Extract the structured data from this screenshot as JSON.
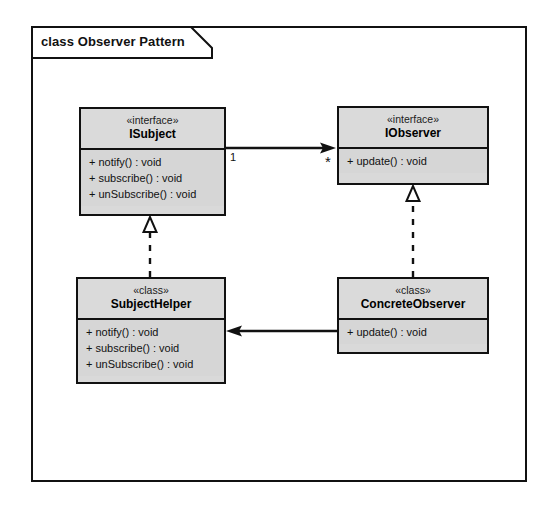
{
  "diagram": {
    "frame_label": "class Observer Pattern",
    "type": "uml-class-diagram"
  },
  "classes": [
    {
      "id": "isubject",
      "stereotype": "«interface»",
      "name": "ISubject",
      "members": [
        "+ notify()  :  void",
        "+ subscribe()  :  void",
        "+ unSubscribe()  :  void"
      ]
    },
    {
      "id": "iobserver",
      "stereotype": "«interface»",
      "name": "IObserver",
      "members": [
        "+ update()  :  void"
      ]
    },
    {
      "id": "subjecthelper",
      "stereotype": "«class»",
      "name": "SubjectHelper",
      "members": [
        "+ notify()  :  void",
        "+ subscribe()  :  void",
        "+ unSubscribe()  :  void"
      ]
    },
    {
      "id": "concreteobserver",
      "stereotype": "«class»",
      "name": "ConcreteObserver",
      "members": [
        "+ update()  :  void"
      ]
    }
  ],
  "relationships": {
    "association_subject_observer": {
      "kind": "association",
      "from": "ISubject",
      "to": "IObserver",
      "source_multiplicity": "1",
      "target_multiplicity": "*"
    },
    "realization_helper_subject": {
      "kind": "realization",
      "from": "SubjectHelper",
      "to": "ISubject"
    },
    "realization_observer_iobserver": {
      "kind": "realization",
      "from": "ConcreteObserver",
      "to": "IObserver"
    },
    "association_observer_helper": {
      "kind": "association",
      "from": "ConcreteObserver",
      "to": "SubjectHelper"
    }
  },
  "colors": {
    "line": "#111111",
    "box_fill": "#d9d9d9",
    "header_fill": "#dadada",
    "page": "#ffffff"
  }
}
